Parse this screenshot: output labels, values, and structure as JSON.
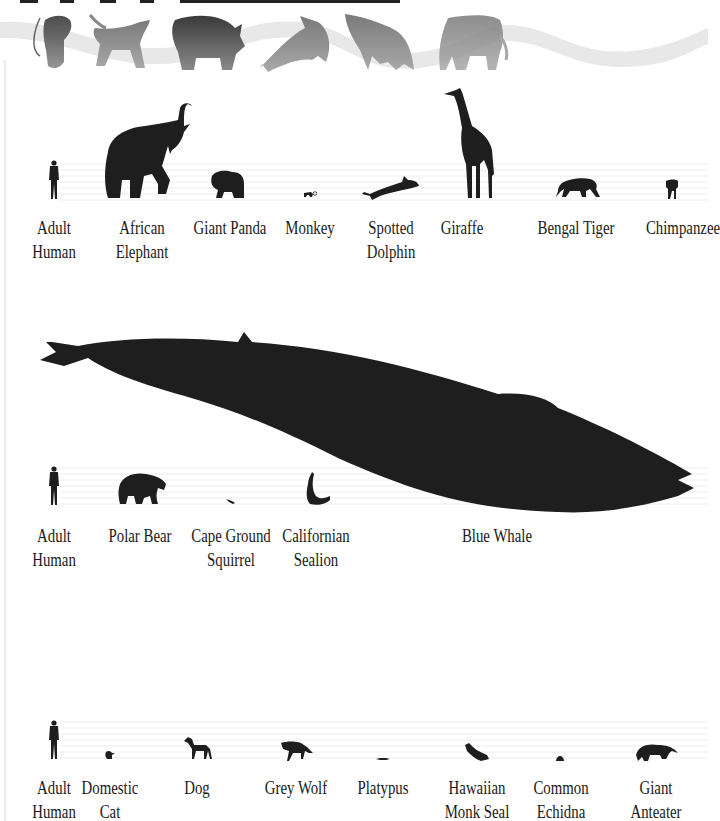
{
  "header": {
    "banner_animals": [
      "rat",
      "dog",
      "rhinoceros",
      "dolphin",
      "bat",
      "elephant"
    ]
  },
  "rows": [
    {
      "name": "row-1",
      "animals": [
        {
          "id": "adult-human",
          "line1": "Adult",
          "line2": "Human"
        },
        {
          "id": "african-elephant",
          "line1": "African",
          "line2": "Elephant"
        },
        {
          "id": "giant-panda",
          "line1": "Giant Panda",
          "line2": ""
        },
        {
          "id": "monkey",
          "line1": "Monkey",
          "line2": ""
        },
        {
          "id": "spotted-dolphin",
          "line1": "Spotted",
          "line2": "Dolphin"
        },
        {
          "id": "giraffe",
          "line1": "Giraffe",
          "line2": ""
        },
        {
          "id": "bengal-tiger",
          "line1": "Bengal Tiger",
          "line2": ""
        },
        {
          "id": "chimpanzee",
          "line1": "Chimpanzee",
          "line2": ""
        }
      ]
    },
    {
      "name": "row-2",
      "animals": [
        {
          "id": "adult-human",
          "line1": "Adult",
          "line2": "Human"
        },
        {
          "id": "polar-bear",
          "line1": "Polar Bear",
          "line2": ""
        },
        {
          "id": "cape-ground-squirrel",
          "line1": "Cape Ground",
          "line2": "Squirrel"
        },
        {
          "id": "californian-sealion",
          "line1": "Californian",
          "line2": "Sealion"
        },
        {
          "id": "blue-whale",
          "line1": "Blue Whale",
          "line2": ""
        }
      ]
    },
    {
      "name": "row-3",
      "animals": [
        {
          "id": "adult-human",
          "line1": "Adult",
          "line2": "Human"
        },
        {
          "id": "domestic-cat",
          "line1": "Domestic",
          "line2": "Cat"
        },
        {
          "id": "dog",
          "line1": "Dog",
          "line2": ""
        },
        {
          "id": "grey-wolf",
          "line1": "Grey Wolf",
          "line2": ""
        },
        {
          "id": "platypus",
          "line1": "Platypus",
          "line2": ""
        },
        {
          "id": "hawaiian-monk-seal",
          "line1": "Hawaiian",
          "line2": "Monk Seal"
        },
        {
          "id": "common-echidna",
          "line1": "Common",
          "line2": "Echidna"
        },
        {
          "id": "giant-anteater",
          "line1": "Giant",
          "line2": "Anteater"
        }
      ]
    }
  ],
  "colors": {
    "silhouette": "#1e1e1e",
    "ground_line": "#ececec",
    "banner_ribbon": "#e6e6e6",
    "label_text": "#1a1a1a"
  }
}
